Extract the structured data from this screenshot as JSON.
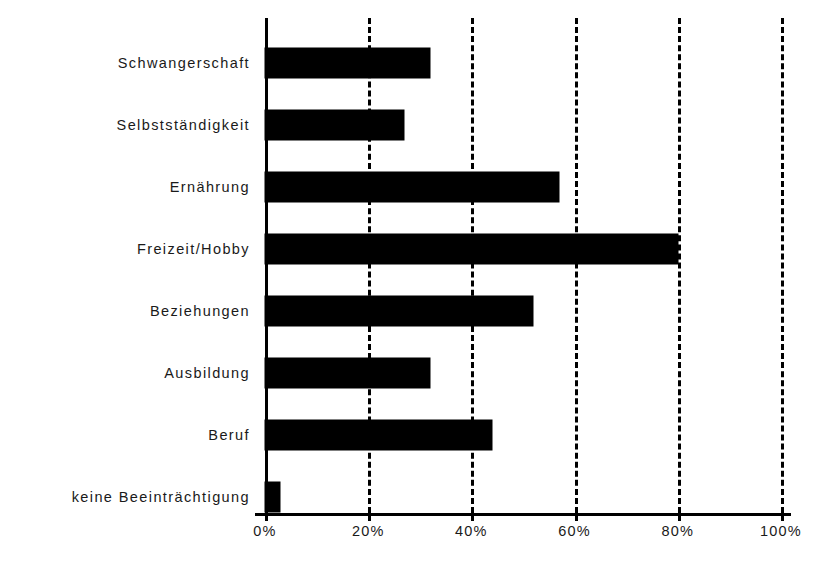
{
  "chart_data": {
    "type": "bar",
    "orientation": "horizontal",
    "title": "",
    "subtitle": "",
    "xlabel": "",
    "ylabel": "",
    "categories": [
      "Schwangerschaft",
      "Selbstständigkeit",
      "Ernährung",
      "Freizeit/Hobby",
      "Beziehungen",
      "Ausbildung",
      "Beruf",
      "keine Beeinträchtigung"
    ],
    "values": [
      32,
      27,
      57,
      80,
      52,
      32,
      44,
      3
    ],
    "value_unit": "%",
    "xlim": [
      0,
      100
    ],
    "xticks": [
      0,
      20,
      40,
      60,
      80,
      100
    ],
    "xtick_labels": [
      "0%",
      "20%",
      "40%",
      "60%",
      "80%",
      "100%"
    ],
    "grid": true,
    "grid_style": "dashed-vertical",
    "legend": false,
    "bar_color": "#000000",
    "axis_color": "#000000",
    "background_color": "#ffffff"
  }
}
